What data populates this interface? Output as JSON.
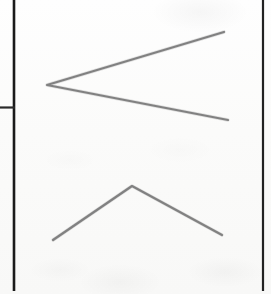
{
  "page": {
    "width": 271,
    "height": 294,
    "background_color": "#fdfdfd"
  },
  "colors": {
    "paper": "#fdfdfd",
    "rule_ink": "#1a1a1a",
    "stroke_ink": "#767676",
    "stroke_ink_light": "#8e8e8e"
  },
  "rules": {
    "left_vertical": {
      "name": "left vertical rule",
      "x1": 14,
      "y1": 0,
      "x2": 14,
      "y2": 291,
      "width": 2.6,
      "color": "#1a1a1a"
    },
    "right_vertical": {
      "name": "right vertical rule",
      "x1": 263,
      "y1": 0,
      "x2": 263,
      "y2": 291,
      "width": 2.2,
      "color": "#222222"
    },
    "left_tick_horizontal": {
      "name": "left horizontal tick rule",
      "x1": 0,
      "y1": 107.5,
      "x2": 15,
      "y2": 107.5,
      "width": 2.2,
      "color": "#2a2a2a"
    }
  },
  "marks": [
    {
      "name": "upper-left-chevron",
      "shape": "chevron",
      "orientation": "less-than",
      "points": "224,32 47,85 228,120",
      "vertex": {
        "x": 47,
        "y": 85
      },
      "endpoints": [
        {
          "x": 224,
          "y": 32
        },
        {
          "x": 228,
          "y": 120
        }
      ],
      "stroke_width": 2.2,
      "color": "#767676"
    },
    {
      "name": "lower-caret-chevron",
      "shape": "chevron",
      "orientation": "caret-up",
      "points": "53,240 132,186 222,235",
      "vertex": {
        "x": 132,
        "y": 186
      },
      "endpoints": [
        {
          "x": 53,
          "y": 240
        },
        {
          "x": 222,
          "y": 235
        }
      ],
      "stroke_width": 2.2,
      "color": "#767676"
    }
  ]
}
